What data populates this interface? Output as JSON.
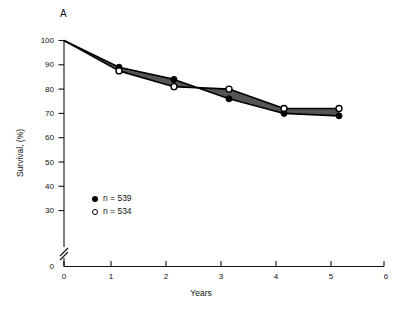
{
  "figure": {
    "panel_label": "A",
    "background_color": "#ffffff"
  },
  "axes": {
    "y_title": "Survival, (%)",
    "x_title": "Years",
    "y_ticks": [
      "100",
      "90",
      "80",
      "70",
      "60",
      "50",
      "40",
      "30"
    ],
    "y_origin_label": "0",
    "x_ticks": [
      "0",
      "1",
      "2",
      "3",
      "4",
      "5",
      "6"
    ],
    "has_axis_break": true,
    "axis_color": "#111111"
  },
  "legend": {
    "entries": [
      {
        "marker": "filled-circle",
        "label": "n = 539"
      },
      {
        "marker": "open-circle",
        "label": "n = 534"
      }
    ]
  },
  "chart_data": {
    "type": "line",
    "title": "A",
    "xlabel": "Years",
    "ylabel": "Survival, (%)",
    "xlim": [
      0,
      6
    ],
    "ylim": [
      30,
      100
    ],
    "y_axis_break_below": 30,
    "grid": false,
    "legend_position": "inside-lower-left",
    "x": [
      0,
      1,
      2,
      3,
      4,
      5
    ],
    "series": [
      {
        "name": "n = 539",
        "marker": "filled-circle",
        "color": "#000000",
        "values": [
          100,
          89,
          84,
          76,
          70,
          69
        ]
      },
      {
        "name": "n = 534",
        "marker": "open-circle",
        "color": "#000000",
        "values": [
          100,
          87.5,
          81,
          80,
          72,
          72
        ]
      }
    ],
    "band": {
      "description": "shaded area between the two survival curves",
      "fill_color": "#555555",
      "border_color": "#000000"
    },
    "annotations": [
      {
        "text": "curves cross between year 2 and year 3"
      }
    ]
  }
}
